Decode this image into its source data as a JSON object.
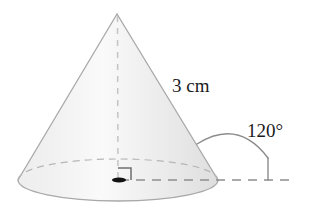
{
  "figure": {
    "shape_name": "cone",
    "labels": {
      "slant_height": "3 cm",
      "angle": "120°"
    },
    "annotations": {
      "axis_name": "dashed-vertical-axis",
      "base_radius_name": "dashed-horizontal-line",
      "right_angle_name": "right-angle-marker",
      "apex_name": "cone-apex",
      "center_name": "base-center-point",
      "arc_name": "angle-arc"
    },
    "colors": {
      "cone_fill_light": "#f4f4f4",
      "cone_fill_mid": "#ececec",
      "cone_fill_shade": "#e2e2e2",
      "outline": "#a8a8a8",
      "dashed": "#9a9a9a",
      "axis_dash": "#c9c9c9",
      "arc": "#8c8c8c",
      "text": "#1b1b1b",
      "dot": "#111111",
      "background": "#ffffff"
    },
    "geometry": {
      "apex_x": 117,
      "apex_y": 14,
      "base_center_x": 118,
      "base_center_y": 180,
      "base_rx": 100,
      "base_ry": 21,
      "horizontal_line_end_x": 296,
      "arc_tick_x": 268,
      "angle_degrees": 120,
      "slant_label_x": 172,
      "slant_label_y": 92,
      "angle_label_x": 247,
      "angle_label_y": 137
    }
  }
}
